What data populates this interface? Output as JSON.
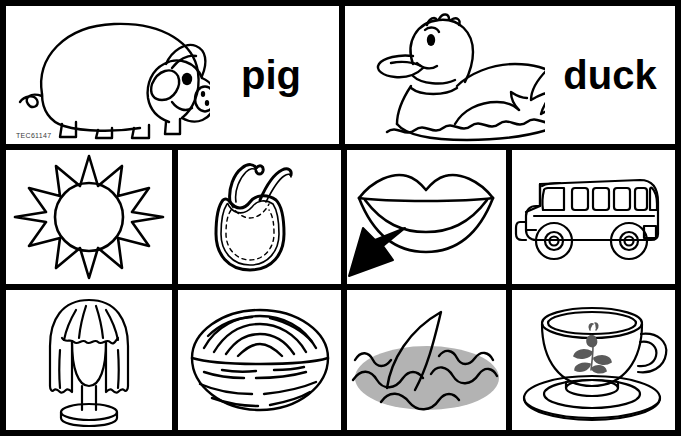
{
  "sheet": {
    "title": "Picture and word cards worksheet",
    "copyright_code": "TEC61147",
    "background_color": "#ffffff",
    "ink_color": "#000000",
    "water_gray": "#b3b3b3",
    "flower_gray": "#5a5a5a",
    "grid": {
      "rows": 3,
      "row1_cells": 2,
      "row2_cells": 4,
      "row3_cells": 4
    }
  },
  "row1": {
    "cards": [
      {
        "picture_name": "pig",
        "word": "pig",
        "icon": "pig-icon",
        "has_word": true
      },
      {
        "picture_name": "duck",
        "word": "duck",
        "icon": "duck-icon",
        "has_word": true
      }
    ]
  },
  "row2": {
    "cards": [
      {
        "picture_name": "sun",
        "icon": "sun-icon",
        "label": "sun"
      },
      {
        "picture_name": "bib",
        "icon": "bib-icon",
        "label": "bib"
      },
      {
        "picture_name": "lips",
        "icon": "lips-icon",
        "label": "lips",
        "has_cursor": true,
        "cursor_icon": "arrow-cursor-icon"
      },
      {
        "picture_name": "bus",
        "icon": "bus-icon",
        "label": "bus"
      }
    ]
  },
  "row3": {
    "cards": [
      {
        "picture_name": "wig",
        "icon": "wig-icon",
        "label": "wig"
      },
      {
        "picture_name": "nut",
        "icon": "nut-icon",
        "label": "nut"
      },
      {
        "picture_name": "fin",
        "icon": "fin-icon",
        "label": "fin"
      },
      {
        "picture_name": "cup",
        "icon": "cup-icon",
        "label": "cup"
      }
    ]
  }
}
